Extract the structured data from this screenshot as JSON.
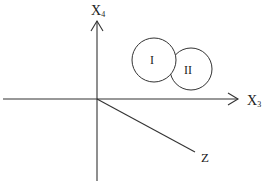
{
  "diagram": {
    "axes": {
      "vertical": {
        "label": "X",
        "subscript": "4"
      },
      "horizontal": {
        "label": "X",
        "subscript": "3"
      },
      "oblique": {
        "label": "Z"
      }
    },
    "regions": [
      {
        "label": "I"
      },
      {
        "label": "II"
      }
    ],
    "colors": {
      "stroke": "#333333",
      "background": "#ffffff"
    }
  }
}
